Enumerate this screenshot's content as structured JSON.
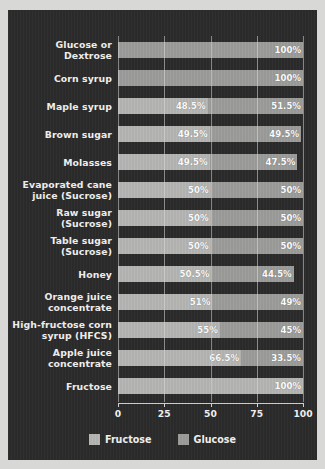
{
  "chart_data": {
    "type": "bar",
    "orientation": "horizontal",
    "stacked": true,
    "title": "",
    "xlabel": "",
    "ylabel": "",
    "xlim": [
      0,
      100
    ],
    "xticks": [
      "0",
      "25",
      "50",
      "75",
      "100"
    ],
    "grid": true,
    "legend_position": "bottom",
    "background_color": "#2c2b2b",
    "series": [
      {
        "name": "Fructose",
        "color": "#b6b6b4",
        "values": [
          0,
          0,
          48.5,
          49.5,
          49.5,
          50,
          50,
          50,
          50.5,
          51,
          55,
          66.5,
          100
        ]
      },
      {
        "name": "Glucose",
        "color": "#9d9d9b",
        "values": [
          100,
          100,
          51.5,
          49.5,
          47.5,
          50,
          50,
          50,
          44.5,
          49,
          45,
          33.5,
          0
        ]
      }
    ],
    "categories": [
      "Glucose or Dextrose",
      "Corn syrup",
      "Maple syrup",
      "Brown sugar",
      "Molasses",
      "Evaporated cane juice (Sucrose)",
      "Raw sugar (Sucrose)",
      "Table sugar (Sucrose)",
      "Honey",
      "Orange juice concentrate",
      "High-fructose corn syrup (HFCS)",
      "Apple juice concentrate",
      "Fructose"
    ],
    "rows": [
      {
        "category_lines": [
          "Glucose or Dextrose"
        ],
        "fructose": 0,
        "glucose": 100,
        "fructose_label": "",
        "glucose_label": "100%"
      },
      {
        "category_lines": [
          "Corn syrup"
        ],
        "fructose": 0,
        "glucose": 100,
        "fructose_label": "",
        "glucose_label": "100%"
      },
      {
        "category_lines": [
          "Maple syrup"
        ],
        "fructose": 48.5,
        "glucose": 51.5,
        "fructose_label": "48.5%",
        "glucose_label": "51.5%"
      },
      {
        "category_lines": [
          "Brown sugar"
        ],
        "fructose": 49.5,
        "glucose": 49.5,
        "fructose_label": "49.5%",
        "glucose_label": "49.5%"
      },
      {
        "category_lines": [
          "Molasses"
        ],
        "fructose": 49.5,
        "glucose": 47.5,
        "fructose_label": "49.5%",
        "glucose_label": "47.5%"
      },
      {
        "category_lines": [
          "Evaporated cane",
          "juice (Sucrose)"
        ],
        "fructose": 50,
        "glucose": 50,
        "fructose_label": "50%",
        "glucose_label": "50%"
      },
      {
        "category_lines": [
          "Raw sugar",
          "(Sucrose)"
        ],
        "fructose": 50,
        "glucose": 50,
        "fructose_label": "50%",
        "glucose_label": "50%"
      },
      {
        "category_lines": [
          "Table sugar",
          "(Sucrose)"
        ],
        "fructose": 50,
        "glucose": 50,
        "fructose_label": "50%",
        "glucose_label": "50%"
      },
      {
        "category_lines": [
          "Honey"
        ],
        "fructose": 50.5,
        "glucose": 44.5,
        "fructose_label": "50.5%",
        "glucose_label": "44.5%"
      },
      {
        "category_lines": [
          "Orange juice",
          "concentrate"
        ],
        "fructose": 51,
        "glucose": 49,
        "fructose_label": "51%",
        "glucose_label": "49%"
      },
      {
        "category_lines": [
          "High-fructose corn",
          "syrup (HFCS)"
        ],
        "fructose": 55,
        "glucose": 45,
        "fructose_label": "55%",
        "glucose_label": "45%"
      },
      {
        "category_lines": [
          "Apple juice",
          "concentrate"
        ],
        "fructose": 66.5,
        "glucose": 33.5,
        "fructose_label": "66.5%",
        "glucose_label": "33.5%"
      },
      {
        "category_lines": [
          "Fructose"
        ],
        "fructose": 100,
        "glucose": 0,
        "fructose_label": "100%",
        "glucose_label": ""
      }
    ],
    "legend": [
      {
        "label": "Fructose",
        "color": "#b6b6b4"
      },
      {
        "label": "Glucose",
        "color": "#9d9d9b"
      }
    ]
  }
}
